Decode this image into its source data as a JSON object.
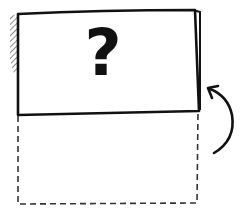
{
  "diagram": {
    "card_symbol": "?",
    "card": {
      "stroke_color": "#111111",
      "fill_color": "#ffffff",
      "state": "flipped-up"
    },
    "folded_area": {
      "style": "dashed",
      "stroke_color": "#333333"
    },
    "arrow": {
      "direction": "up-counterclockwise",
      "stroke_color": "#111111"
    },
    "shading": {
      "style": "hatched",
      "color": "#555555"
    }
  }
}
